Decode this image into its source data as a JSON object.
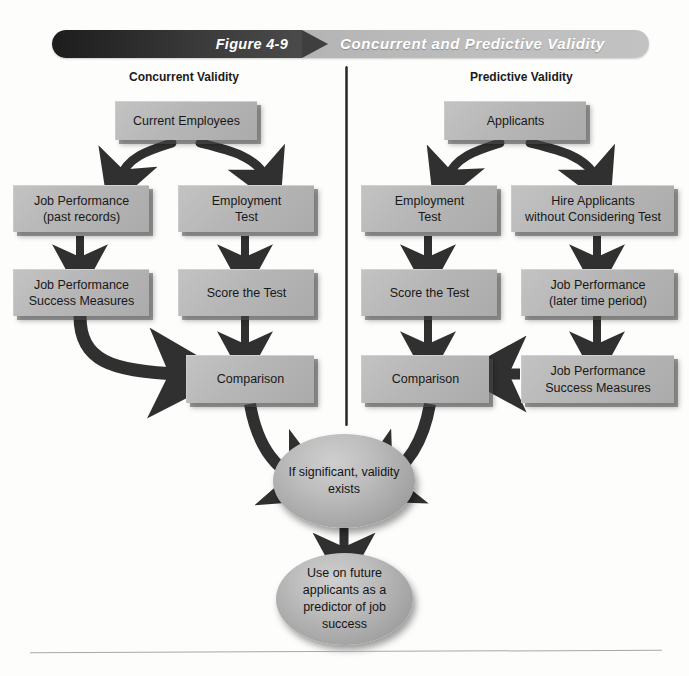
{
  "banner": {
    "figure_label": "Figure 4-9",
    "title": "Concurrent and Predictive Validity"
  },
  "columns": {
    "left_heading": "Concurrent Validity",
    "right_heading": "Predictive Validity"
  },
  "boxes": {
    "current_employees": "Current Employees",
    "applicants": "Applicants",
    "job_performance_past_line1": "Job Performance",
    "job_performance_past_line2": "(past records)",
    "employment_test_left_line1": "Employment",
    "employment_test_left_line2": "Test",
    "employment_test_right_line1": "Employment",
    "employment_test_right_line2": "Test",
    "hire_applicants_line1": "Hire Applicants",
    "hire_applicants_line2": "without Considering Test",
    "job_perf_success_left_line1": "Job Performance",
    "job_perf_success_left_line2": "Success Measures",
    "score_test_left": "Score the Test",
    "score_test_right": "Score the Test",
    "job_performance_later_line1": "Job Performance",
    "job_performance_later_line2": "(later time period)",
    "comparison_left": "Comparison",
    "comparison_right": "Comparison",
    "job_perf_success_right_line1": "Job Performance",
    "job_perf_success_right_line2": "Success Measures"
  },
  "ellipses": {
    "significant_line1": "If significant,",
    "significant_line2": "validity exists",
    "future_line1": "Use on future",
    "future_line2": "applicants as a",
    "future_line3": "predictor of",
    "future_line4": "job success"
  },
  "colors": {
    "box_fill": "#b6b6b6",
    "banner_dark": "#2b2b2b",
    "banner_light": "#b4b4b4",
    "arrow": "#303030",
    "page_background": "#fdfdfc"
  }
}
